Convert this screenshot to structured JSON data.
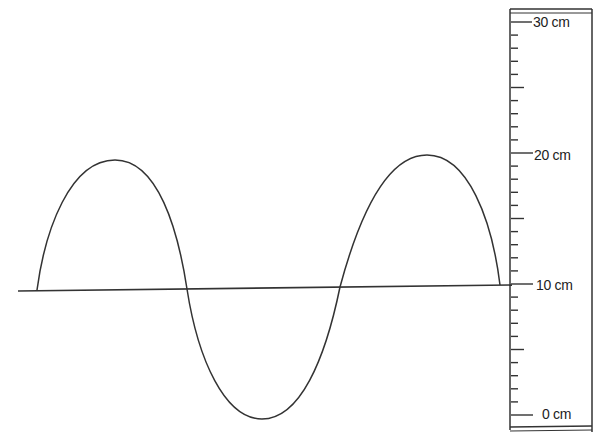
{
  "diagram": {
    "type": "transverse-wave-with-ruler",
    "wave": {
      "description": "Sine wave, 1.5 wavelengths, starting at equilibrium going up",
      "equilibrium_cm": 10,
      "crest_cm": 20,
      "trough_cm": 0,
      "amplitude_cm": 10,
      "stroke_color": "#333333"
    },
    "ruler": {
      "min_cm": 0,
      "max_cm": 30,
      "minor_tick_cm": 1,
      "major_tick_cm": 5,
      "labels": [
        {
          "value": 30,
          "text": "30 cm"
        },
        {
          "value": 20,
          "text": "20 cm"
        },
        {
          "value": 10,
          "text": "10 cm"
        },
        {
          "value": 0,
          "text": "0 cm"
        }
      ]
    }
  }
}
